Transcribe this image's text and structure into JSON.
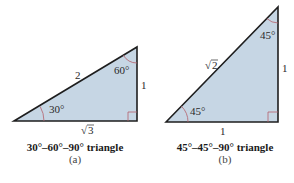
{
  "colors": {
    "fill": "#c6d6e4",
    "stroke": "#1e1e1e",
    "arc": "#b5606a",
    "right_angle": "#b5606a"
  },
  "triangle_a": {
    "hypotenuse_label": "2",
    "vertical_side_label": "1",
    "base_label_radicand": "3",
    "base_label_symbol": "√",
    "angle_bottom_left": "30°",
    "angle_top_right": "60°",
    "caption_title": "30°–60°–90° triangle",
    "caption_sub": "(a)"
  },
  "triangle_b": {
    "hypotenuse_label_symbol": "√",
    "hypotenuse_label_radicand": "2",
    "vertical_side_label": "1",
    "base_label": "1",
    "angle_bottom_left": "45°",
    "angle_top_right": "45°",
    "caption_title": "45°–45°–90° triangle",
    "caption_sub": "(b)"
  }
}
